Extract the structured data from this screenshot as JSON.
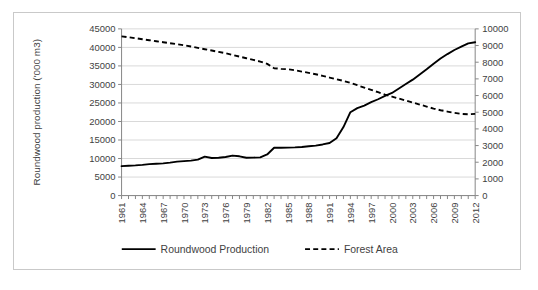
{
  "chart_data": {
    "type": "line",
    "title": "",
    "xlabel": "",
    "grid": true,
    "legend_position": "bottom",
    "x": [
      1961,
      1962,
      1963,
      1964,
      1965,
      1966,
      1967,
      1968,
      1969,
      1970,
      1971,
      1972,
      1973,
      1974,
      1975,
      1976,
      1977,
      1978,
      1979,
      1980,
      1981,
      1982,
      1983,
      1984,
      1985,
      1986,
      1987,
      1988,
      1989,
      1990,
      1991,
      1992,
      1993,
      1994,
      1995,
      1996,
      1997,
      1998,
      1999,
      2000,
      2001,
      2002,
      2003,
      2004,
      2005,
      2006,
      2007,
      2008,
      2009,
      2010,
      2011,
      2012
    ],
    "xtick_labels": [
      "1961",
      "1964",
      "1967",
      "1970",
      "1973",
      "1976",
      "1979",
      "1982",
      "1985",
      "1988",
      "1991",
      "1994",
      "1997",
      "2000",
      "2003",
      "2006",
      "2009",
      "2012"
    ],
    "xtick_step": 3,
    "left_axis": {
      "label": "Roundwood production ('000 m3)",
      "ylim": [
        0,
        45000
      ],
      "ticks": [
        0,
        5000,
        10000,
        15000,
        20000,
        25000,
        30000,
        35000,
        40000,
        45000
      ],
      "tick_labels": [
        "0",
        "5000",
        "10000",
        "15000",
        "20000",
        "25000",
        "30000",
        "35000",
        "40000",
        "45000"
      ]
    },
    "right_axis": {
      "label": "Forest Area ('000 ha)",
      "ylim": [
        0,
        10000
      ],
      "ticks": [
        0,
        1000,
        2000,
        3000,
        4000,
        5000,
        6000,
        7000,
        8000,
        9000,
        10000
      ],
      "tick_labels": [
        "0",
        "1000",
        "2000",
        "3000",
        "4000",
        "5000",
        "6000",
        "7000",
        "8000",
        "9000",
        "10000"
      ]
    },
    "series": [
      {
        "name": "Roundwood Production",
        "axis": "left",
        "style": "solid",
        "color": "#000000",
        "values": [
          7950,
          8050,
          8150,
          8300,
          8500,
          8600,
          8700,
          8900,
          9150,
          9300,
          9450,
          9700,
          10500,
          10150,
          10200,
          10400,
          10800,
          10600,
          10200,
          10250,
          10300,
          11100,
          12900,
          12900,
          12950,
          13000,
          13100,
          13300,
          13500,
          13800,
          14200,
          15500,
          18500,
          22500,
          23600,
          24300,
          25200,
          26000,
          26900,
          27700,
          28900,
          30100,
          31300,
          32700,
          34100,
          35600,
          37000,
          38200,
          39300,
          40200,
          41100,
          41400
        ]
      },
      {
        "name": "Forest Area",
        "axis": "right",
        "style": "dashed",
        "color": "#000000",
        "values": [
          9550,
          9500,
          9440,
          9380,
          9320,
          9260,
          9200,
          9140,
          9080,
          9020,
          8940,
          8860,
          8780,
          8700,
          8620,
          8540,
          8440,
          8340,
          8240,
          8140,
          8040,
          7900,
          7640,
          7600,
          7580,
          7520,
          7440,
          7360,
          7280,
          7180,
          7080,
          6980,
          6880,
          6760,
          6620,
          6480,
          6340,
          6200,
          6060,
          5940,
          5820,
          5700,
          5580,
          5460,
          5340,
          5220,
          5120,
          5040,
          4960,
          4900,
          4880,
          4900
        ]
      }
    ]
  },
  "legend": {
    "items": [
      {
        "label": "Roundwood Production",
        "style": "solid"
      },
      {
        "label": "Forest Area",
        "style": "dashed"
      }
    ]
  }
}
